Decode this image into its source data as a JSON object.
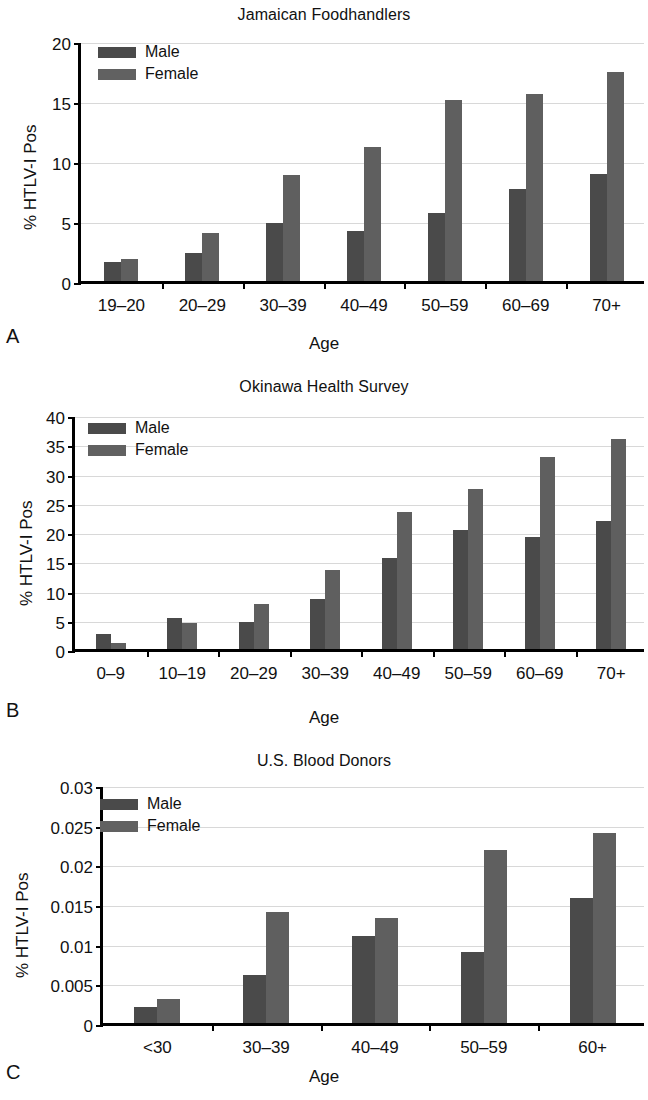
{
  "figure": {
    "panels": [
      {
        "letter": "A",
        "title": "Jamaican Foodhandlers",
        "xlabel": "Age",
        "ylabel": "% HTLV-I Pos",
        "legend": {
          "male": "Male",
          "female": "Female"
        },
        "yticks": [
          "0",
          "5",
          "10",
          "15",
          "20"
        ],
        "categories": [
          "19–20",
          "20–29",
          "30–39",
          "40–49",
          "50–59",
          "60–69",
          "70+"
        ],
        "male": [
          1.6,
          2.3,
          4.8,
          4.2,
          5.7,
          7.7,
          8.9
        ],
        "female": [
          1.8,
          4.0,
          8.8,
          11.2,
          15.1,
          15.6,
          17.4
        ],
        "ymin": 0,
        "ymax": 20,
        "ystep": 5
      },
      {
        "letter": "B",
        "title": "Okinawa Health Survey",
        "xlabel": "Age",
        "ylabel": "% HTLV-I Pos",
        "legend": {
          "male": "Male",
          "female": "Female"
        },
        "yticks": [
          "0",
          "5",
          "10",
          "15",
          "20",
          "25",
          "30",
          "35",
          "40"
        ],
        "categories": [
          "0–9",
          "10–19",
          "20–29",
          "30–39",
          "40–49",
          "50–59",
          "60–69",
          "70+"
        ],
        "male": [
          2.6,
          5.3,
          4.6,
          8.6,
          15.5,
          20.4,
          19.2,
          21.8
        ],
        "female": [
          1.0,
          4.5,
          7.7,
          13.5,
          23.4,
          27.3,
          32.8,
          35.9
        ],
        "ymin": 0,
        "ymax": 40,
        "ystep": 5
      },
      {
        "letter": "C",
        "title": "U.S. Blood Donors",
        "xlabel": "Age",
        "ylabel": "% HTLV-I Pos",
        "legend": {
          "male": "Male",
          "female": "Female"
        },
        "yticks": [
          "0",
          "0.005",
          "0.01",
          "0.015",
          "0.02",
          "0.025",
          "0.03"
        ],
        "categories": [
          "<30",
          "30–39",
          "40–49",
          "50–59",
          "60+"
        ],
        "male": [
          0.002,
          0.006,
          0.011,
          0.0089,
          0.0158
        ],
        "female": [
          0.003,
          0.014,
          0.0133,
          0.0218,
          0.0239
        ],
        "ymin": 0,
        "ymax": 0.03,
        "ystep": 0.005
      }
    ],
    "colors": {
      "male_bar": "#4a4a4a",
      "female_bar": "#5f5f5f",
      "axis": "#000000",
      "gridline": "#d8d8d8",
      "background": "#ffffff"
    }
  },
  "chart_data": [
    {
      "type": "bar",
      "title": "Jamaican Foodhandlers",
      "xlabel": "Age",
      "ylabel": "% HTLV-I Pos",
      "categories": [
        "19–20",
        "20–29",
        "30–39",
        "40–49",
        "50–59",
        "60–69",
        "70+"
      ],
      "series": [
        {
          "name": "Male",
          "values": [
            1.6,
            2.3,
            4.8,
            4.2,
            5.7,
            7.7,
            8.9
          ]
        },
        {
          "name": "Female",
          "values": [
            1.8,
            4.0,
            8.8,
            11.2,
            15.1,
            15.6,
            17.4
          ]
        }
      ],
      "ylim": [
        0,
        20
      ],
      "ytick_values": [
        0,
        5,
        10,
        15,
        20
      ],
      "grid": true,
      "legend_position": "top-left",
      "panel_label": "A"
    },
    {
      "type": "bar",
      "title": "Okinawa Health Survey",
      "xlabel": "Age",
      "ylabel": "% HTLV-I Pos",
      "categories": [
        "0–9",
        "10–19",
        "20–29",
        "30–39",
        "40–49",
        "50–59",
        "60–69",
        "70+"
      ],
      "series": [
        {
          "name": "Male",
          "values": [
            2.6,
            5.3,
            4.6,
            8.6,
            15.5,
            20.4,
            19.2,
            21.8
          ]
        },
        {
          "name": "Female",
          "values": [
            1.0,
            4.5,
            7.7,
            13.5,
            23.4,
            27.3,
            32.8,
            35.9
          ]
        }
      ],
      "ylim": [
        0,
        40
      ],
      "ytick_values": [
        0,
        5,
        10,
        15,
        20,
        25,
        30,
        35,
        40
      ],
      "grid": true,
      "legend_position": "top-left",
      "panel_label": "B"
    },
    {
      "type": "bar",
      "title": "U.S. Blood Donors",
      "xlabel": "Age",
      "ylabel": "% HTLV-I Pos",
      "categories": [
        "<30",
        "30–39",
        "40–49",
        "50–59",
        "60+"
      ],
      "series": [
        {
          "name": "Male",
          "values": [
            0.002,
            0.006,
            0.011,
            0.0089,
            0.0158
          ]
        },
        {
          "name": "Female",
          "values": [
            0.003,
            0.014,
            0.0133,
            0.0218,
            0.0239
          ]
        }
      ],
      "ylim": [
        0,
        0.03
      ],
      "ytick_values": [
        0,
        0.005,
        0.01,
        0.015,
        0.02,
        0.025,
        0.03
      ],
      "grid": true,
      "legend_position": "top-left",
      "panel_label": "C"
    }
  ]
}
